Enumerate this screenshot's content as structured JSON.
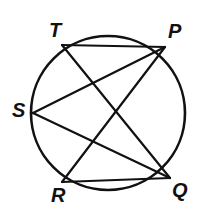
{
  "figure": {
    "type": "circle-with-inscribed-chords",
    "stroke_color": "#111111",
    "background_color": "#ffffff",
    "circle": {
      "cx": 108,
      "cy": 113,
      "r": 77,
      "stroke_width": 2.6
    },
    "points": [
      {
        "id": "T",
        "label": "T",
        "x": 62,
        "y": 45,
        "label_x": 49,
        "label_y": 20
      },
      {
        "id": "P",
        "label": "P",
        "x": 165,
        "y": 47,
        "label_x": 168,
        "label_y": 21
      },
      {
        "id": "S",
        "label": "S",
        "x": 33,
        "y": 113,
        "label_x": 12,
        "label_y": 100
      },
      {
        "id": "R",
        "label": "R",
        "x": 62,
        "y": 182,
        "label_x": 51,
        "label_y": 185
      },
      {
        "id": "Q",
        "label": "Q",
        "x": 170,
        "y": 178,
        "label_x": 172,
        "label_y": 180
      }
    ],
    "chords": [
      {
        "id": "TP",
        "from": "T",
        "to": "P",
        "x1": 62,
        "y1": 45,
        "x2": 165,
        "y2": 47,
        "stroke_width": 2.2
      },
      {
        "id": "TQ",
        "from": "T",
        "to": "Q",
        "x1": 62,
        "y1": 45,
        "x2": 170,
        "y2": 178,
        "stroke_width": 2.2
      },
      {
        "id": "SP",
        "from": "S",
        "to": "P",
        "x1": 33,
        "y1": 113,
        "x2": 165,
        "y2": 47,
        "stroke_width": 2.2
      },
      {
        "id": "SQ",
        "from": "S",
        "to": "Q",
        "x1": 33,
        "y1": 113,
        "x2": 170,
        "y2": 178,
        "stroke_width": 2.2
      },
      {
        "id": "RP",
        "from": "R",
        "to": "P",
        "x1": 62,
        "y1": 182,
        "x2": 165,
        "y2": 47,
        "stroke_width": 2.2
      },
      {
        "id": "RQ",
        "from": "R",
        "to": "Q",
        "x1": 62,
        "y1": 182,
        "x2": 170,
        "y2": 178,
        "stroke_width": 2.2
      }
    ]
  }
}
